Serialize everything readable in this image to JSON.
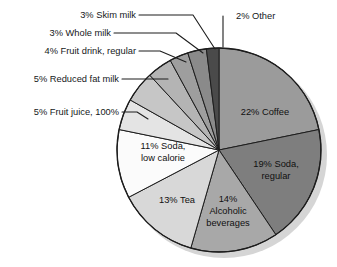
{
  "chart_data": {
    "type": "pie",
    "title": "",
    "subtitle": "",
    "xlabel": "",
    "ylabel": "",
    "legend_position": "none",
    "grid": false,
    "units": "percent",
    "total_percent": 101,
    "start_angle_deg": 0,
    "direction": "clockwise",
    "categories": [
      "Coffee",
      "Soda, regular",
      "Alcoholic beverages",
      "Tea",
      "Soda, low calorie",
      "Fruit juice, 100%",
      "Reduced fat milk",
      "Fruit drink, regular",
      "Whole milk",
      "Skim milk",
      "Other"
    ],
    "values": [
      22,
      19,
      14,
      13,
      11,
      5,
      5,
      4,
      3,
      3,
      2
    ],
    "slices": [
      {
        "key": "coffee",
        "label": "22% Coffee",
        "name": "Coffee",
        "value": 22,
        "color": "#9b9b9b",
        "label_placement": "inside",
        "label_lines": [
          "22% Coffee"
        ]
      },
      {
        "key": "soda-regular",
        "label": "19% Soda, regular",
        "name": "Soda, regular",
        "value": 19,
        "color": "#7e7e7e",
        "label_placement": "inside",
        "label_lines": [
          "19% Soda,",
          "regular"
        ]
      },
      {
        "key": "alcoholic-beverages",
        "label": "14% Alcoholic beverages",
        "name": "Alcoholic beverages",
        "value": 14,
        "color": "#a8a8a8",
        "label_placement": "inside",
        "label_lines": [
          "14%",
          "Alcoholic",
          "beverages"
        ]
      },
      {
        "key": "tea",
        "label": "13% Tea",
        "name": "Tea",
        "value": 13,
        "color": "#d8d8d8",
        "label_placement": "inside",
        "label_lines": [
          "13% Tea"
        ]
      },
      {
        "key": "soda-low-calorie",
        "label": "11% Soda, low calorie",
        "name": "Soda, low calorie",
        "value": 11,
        "color": "#fbfbfb",
        "label_placement": "inside",
        "label_lines": [
          "11% Soda,",
          "low calorie"
        ]
      },
      {
        "key": "fruit-juice",
        "label": "5% Fruit juice, 100%",
        "name": "Fruit juice, 100%",
        "value": 5,
        "color": "#e4e4e4",
        "label_placement": "callout",
        "label_lines": [
          "5% Fruit juice, 100%"
        ]
      },
      {
        "key": "reduced-fat-milk",
        "label": "5% Reduced fat milk",
        "name": "Reduced fat milk",
        "value": 5,
        "color": "#c6c6c6",
        "label_placement": "callout",
        "label_lines": [
          "5% Reduced fat milk"
        ]
      },
      {
        "key": "fruit-drink-regular",
        "label": "4% Fruit drink, regular",
        "name": "Fruit drink, regular",
        "value": 4,
        "color": "#b4b4b4",
        "label_placement": "callout",
        "label_lines": [
          "4% Fruit drink, regular"
        ]
      },
      {
        "key": "whole-milk",
        "label": "3% Whole milk",
        "name": "Whole milk",
        "value": 3,
        "color": "#9e9e9e",
        "label_placement": "callout",
        "label_lines": [
          "3% Whole milk"
        ]
      },
      {
        "key": "skim-milk",
        "label": "3% Skim milk",
        "name": "Skim milk",
        "value": 3,
        "color": "#8a8a8a",
        "label_placement": "callout",
        "label_lines": [
          "3% Skim milk"
        ]
      },
      {
        "key": "other",
        "label": "2% Other",
        "name": "Other",
        "value": 2,
        "color": "#4a4a4a",
        "label_placement": "callout",
        "label_lines": [
          "2% Other"
        ]
      }
    ]
  },
  "figure": {
    "background_color": "#ffffff",
    "outline_color": "#1d1d1d",
    "shadow_color": "#d5d5d5",
    "center_x": 219,
    "center_y": 150,
    "radius": 102
  },
  "callouts": {
    "skim_milk": "3% Skim milk",
    "whole_milk": "3% Whole milk",
    "fruit_drink_regular": "4% Fruit drink, regular",
    "reduced_fat_milk": "5% Reduced fat milk",
    "fruit_juice": "5% Fruit juice, 100%",
    "other": "2% Other"
  },
  "inner_labels": {
    "coffee": "22% Coffee",
    "soda_regular_line1": "19% Soda,",
    "soda_regular_line2": "regular",
    "alcoholic_line1": "14%",
    "alcoholic_line2": "Alcoholic",
    "alcoholic_line3": "beverages",
    "tea": "13% Tea",
    "soda_low_line1": "11% Soda,",
    "soda_low_line2": "low calorie"
  }
}
